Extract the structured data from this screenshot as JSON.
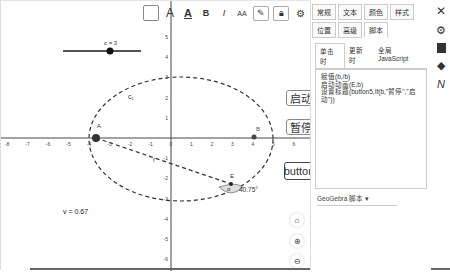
{
  "toolbar": {
    "items": [
      {
        "name": "background-color",
        "icon": "square-box"
      },
      {
        "name": "text-color",
        "label": "A"
      },
      {
        "name": "underline",
        "label": "A"
      },
      {
        "name": "bold",
        "label": "B"
      },
      {
        "name": "italic",
        "label": "I"
      },
      {
        "name": "font-size",
        "label": "AA"
      },
      {
        "name": "pin",
        "icon": "pin-icon"
      },
      {
        "name": "lock",
        "icon": "lock-icon"
      },
      {
        "name": "settings",
        "icon": "gear-icon"
      },
      {
        "name": "more",
        "icon": "more-vertical-icon"
      },
      {
        "name": "toggle-style-bar",
        "icon": "stylebar-icon"
      }
    ]
  },
  "graphics": {
    "slider": {
      "label": "c = 3"
    },
    "labels": {
      "c1": "c₁",
      "A": "A",
      "B": "B",
      "E": "E",
      "f": "f",
      "alpha_sym": "α",
      "alpha_value": "40.75°",
      "v": "v = 0.67"
    },
    "buttons": {
      "start": "启动",
      "pause": "暂停",
      "button5": "button"
    },
    "x_ticks": [
      "-8",
      "-7",
      "-6",
      "-5",
      "-4",
      "-3",
      "-2",
      "-1",
      "0",
      "1",
      "2",
      "3",
      "4",
      "5",
      "6"
    ],
    "y_ticks_pos": [
      "5",
      "4",
      "3",
      "2",
      "1"
    ],
    "y_ticks_neg": [
      "-1",
      "-2",
      "-3",
      "-4",
      "-5",
      "-6"
    ]
  },
  "properties": {
    "tabs": [
      "常规",
      "文本",
      "颜色",
      "样式",
      "位置",
      "高级",
      "脚本"
    ],
    "active_tab": "脚本",
    "subtabs": [
      "单击时",
      "更新时",
      "全局 JavaScript"
    ],
    "active_subtab": "单击时",
    "script": "赋值(b,/b)\n启动动画(E,b)\n设置标题(button5,If(b,\"暂停\",\"启动\"))",
    "language": "GeoGebra 脚本"
  },
  "side_icons": [
    "close-icon",
    "gear-icon",
    "algebra-icon",
    "graphics-icon",
    "text-icon"
  ],
  "zoom_controls": [
    "home-icon",
    "zoom-in-icon",
    "zoom-out-icon"
  ]
}
